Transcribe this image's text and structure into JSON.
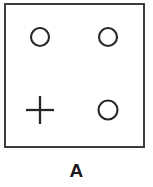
{
  "figure": {
    "panel_label": "A",
    "box": {
      "x": 4,
      "y": 3,
      "width": 141,
      "height": 145,
      "border_color": "#3c3c3c",
      "border_width": 2,
      "background": "#ffffff"
    },
    "symbol_color": "#262626",
    "symbols": [
      {
        "id": "symbol-top-left",
        "shape": "circle",
        "icon_name": "circle-icon",
        "cx": 40,
        "cy": 37,
        "diameter": 18,
        "row": "top",
        "column": "left"
      },
      {
        "id": "symbol-top-right",
        "shape": "circle",
        "icon_name": "circle-icon",
        "cx": 108,
        "cy": 37,
        "diameter": 18,
        "row": "top",
        "column": "right"
      },
      {
        "id": "symbol-bottom-left",
        "shape": "plus",
        "icon_name": "plus-icon",
        "cx": 40,
        "cy": 110,
        "diameter": 28,
        "row": "bottom",
        "column": "left"
      },
      {
        "id": "symbol-bottom-right",
        "shape": "circle",
        "icon_name": "circle-icon",
        "cx": 108,
        "cy": 110,
        "diameter": 19,
        "row": "bottom",
        "column": "right"
      }
    ]
  }
}
